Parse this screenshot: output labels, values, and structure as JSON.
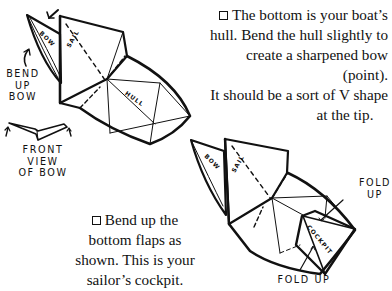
{
  "instructions": [
    {
      "checkbox": "unchecked",
      "lines": [
        "The bottom is your boat’s",
        "hull. Bend the hull slightly to",
        "create a sharpened bow (point).",
        "It should be a sort of V shape",
        "at the tip."
      ]
    },
    {
      "checkbox": "unchecked",
      "lines": [
        "Bend up the",
        "bottom flaps as",
        "shown. This is your",
        "sailor’s cockpit."
      ]
    }
  ],
  "figure1": {
    "labels": {
      "bend_up_bow": [
        "BEND",
        "UP",
        "BOW"
      ],
      "front_view": [
        "FRONT",
        "VIEW",
        "OF BOW"
      ],
      "bow": "BOW",
      "sail": "SAIL",
      "hull": "HULL"
    }
  },
  "figure2": {
    "labels": {
      "fold_up_top": [
        "FOLD",
        "UP"
      ],
      "fold_up_bottom": "FOLD UP",
      "bow": "BOW",
      "sail": "SAIL",
      "cockpit": "COCKPIT"
    }
  }
}
